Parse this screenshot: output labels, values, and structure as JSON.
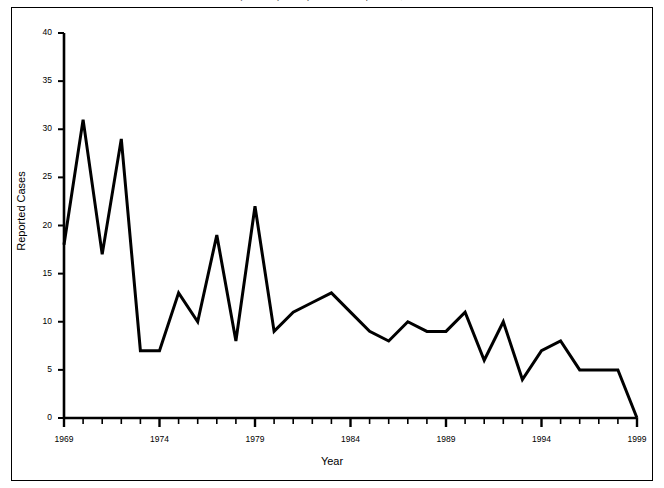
{
  "figure": {
    "clipped_title": "Measles (Rubeola) — Reported Cases per Year, United States",
    "background_color": "#ffffff",
    "border_color": "#000000",
    "line_color": "#000000"
  },
  "chart_data": {
    "type": "line",
    "title": "",
    "xlabel": "Year",
    "ylabel": "Reported Cases",
    "xlim": [
      1969,
      1999
    ],
    "ylim": [
      0,
      40
    ],
    "ytick_values": [
      0,
      5,
      10,
      15,
      20,
      25,
      30,
      35,
      40
    ],
    "ytick_labels": [
      "0",
      "5",
      "10",
      "15",
      "20",
      "25",
      "30",
      "35",
      "40"
    ],
    "xtick_labels": [
      "1969",
      "1974",
      "1979",
      "1984",
      "1989",
      "1994",
      "1999"
    ],
    "xtick_values": [
      1969,
      1974,
      1979,
      1984,
      1989,
      1994,
      1999
    ],
    "minor_xticks_every": 1,
    "grid": false,
    "legend": false,
    "x": [
      1969,
      1970,
      1971,
      1972,
      1973,
      1974,
      1975,
      1976,
      1977,
      1978,
      1979,
      1980,
      1981,
      1982,
      1983,
      1984,
      1985,
      1986,
      1987,
      1988,
      1989,
      1990,
      1991,
      1992,
      1993,
      1994,
      1995,
      1996,
      1997,
      1998,
      1999
    ],
    "values": [
      18,
      31,
      17,
      29,
      7,
      7,
      13,
      10,
      19,
      8,
      22,
      9,
      11,
      12,
      13,
      11,
      9,
      8,
      10,
      9,
      9,
      11,
      6,
      10,
      4,
      7,
      8,
      5,
      5,
      5,
      0
    ],
    "series": [
      {
        "name": "Reported Cases",
        "values": [
          18,
          31,
          17,
          29,
          7,
          7,
          13,
          10,
          19,
          8,
          22,
          9,
          11,
          12,
          13,
          11,
          9,
          8,
          10,
          9,
          9,
          11,
          6,
          10,
          4,
          7,
          8,
          5,
          5,
          5,
          0
        ]
      }
    ]
  }
}
